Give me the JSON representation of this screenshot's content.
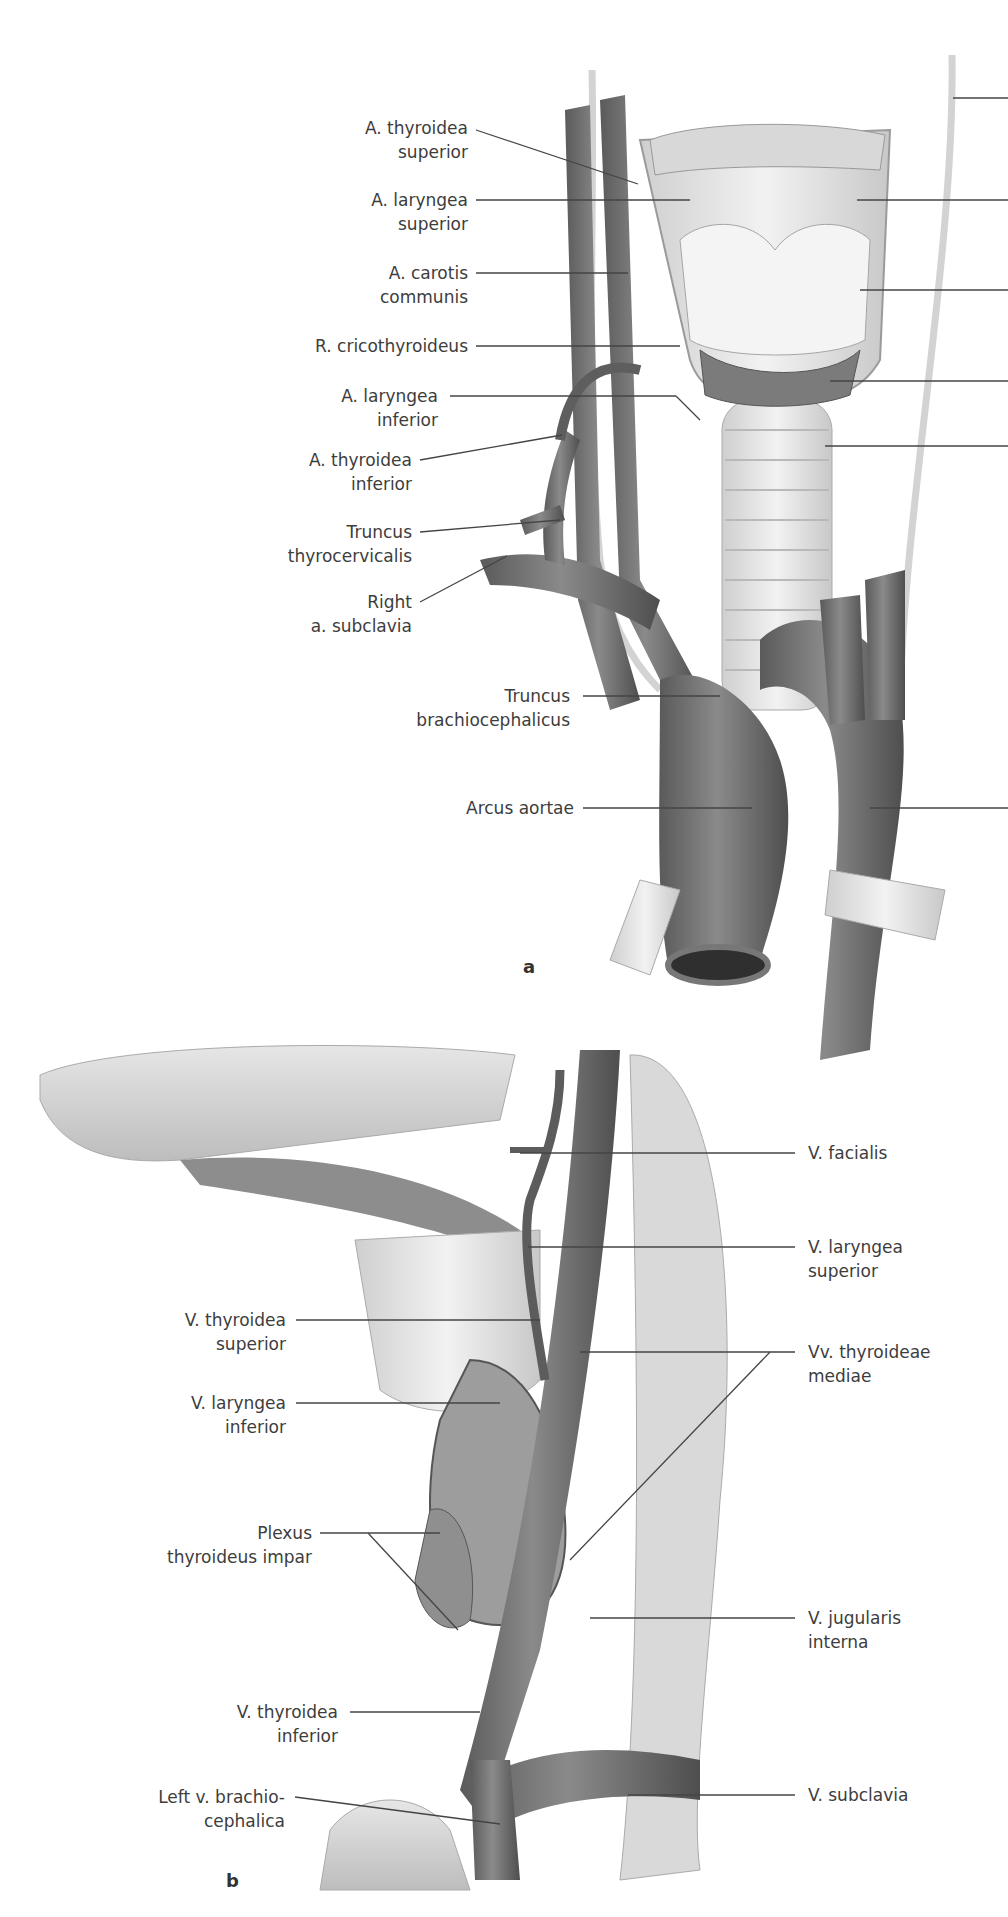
{
  "figure_a": {
    "panel_letter": "a",
    "labels_left": [
      {
        "line1": "A. thyroidea",
        "line2": "superior"
      },
      {
        "line1": "A. laryngea",
        "line2": "superior"
      },
      {
        "line1": "A. carotis",
        "line2": "communis"
      },
      {
        "line1": "R. cricothyroideus",
        "line2": ""
      },
      {
        "line1": "A. laryngea",
        "line2": "inferior"
      },
      {
        "line1": "A. thyroidea",
        "line2": "inferior"
      },
      {
        "line1": "Truncus",
        "line2": "thyrocervicalis"
      },
      {
        "line1": "Right",
        "line2": "a. subclavia"
      },
      {
        "line1": "Truncus",
        "line2": "brachiocephalicus"
      },
      {
        "line1": "Arcus aortae",
        "line2": ""
      }
    ]
  },
  "figure_b": {
    "panel_letter": "b",
    "labels_right": [
      {
        "line1": "V. facialis",
        "line2": ""
      },
      {
        "line1": "V. laryngea",
        "line2": "superior"
      },
      {
        "line1": "Vv. thyroideae",
        "line2": "mediae"
      },
      {
        "line1": "V. jugularis",
        "line2": "interna"
      },
      {
        "line1": "V. subclavia",
        "line2": ""
      }
    ],
    "labels_left": [
      {
        "line1": "V. thyroidea",
        "line2": "superior"
      },
      {
        "line1": "V. laryngea",
        "line2": "inferior"
      },
      {
        "line1": "Plexus",
        "line2": "thyroideus impar"
      },
      {
        "line1": "V. thyroidea",
        "line2": "inferior"
      },
      {
        "line1": "Left v. brachio-",
        "line2": "cephalica"
      }
    ]
  },
  "colors": {
    "vessel": "#6f6f6f",
    "vessel_dark": "#4e4e4e",
    "cartilage": "#e4e4e4",
    "nerve": "#d6d6d6",
    "leader_line": "#444444"
  }
}
